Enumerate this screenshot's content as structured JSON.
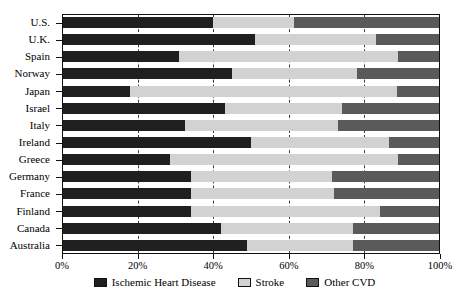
{
  "chart_data": {
    "type": "bar",
    "subtype": "stacked-horizontal-100",
    "title": "",
    "xlabel": "",
    "ylabel": "",
    "xlim": [
      0,
      100
    ],
    "xticks": [
      0,
      20,
      40,
      60,
      80,
      100
    ],
    "xtick_labels": [
      "0%",
      "20%",
      "40%",
      "60%",
      "80%",
      "100%"
    ],
    "grid": true,
    "grid_axis": "x",
    "grid_style": "dashed",
    "legend_position": "bottom-center",
    "categories": [
      "U.S.",
      "U.K.",
      "Spain",
      "Norway",
      "Japan",
      "Israel",
      "Italy",
      "Ireland",
      "Greece",
      "Germany",
      "France",
      "Finland",
      "Canada",
      "Australia"
    ],
    "series": [
      {
        "name": "Ischemic Heart Disease",
        "color": "#1f1f1f",
        "values": [
          40,
          51,
          31,
          45,
          18,
          43,
          32.5,
          50,
          28.5,
          34,
          34,
          34,
          42,
          49
        ]
      },
      {
        "name": "Stroke",
        "color": "#d2d2d2",
        "values": [
          21.5,
          32,
          58,
          33,
          70.5,
          31,
          40.5,
          36.5,
          60.5,
          37.5,
          38,
          50,
          35,
          28
        ]
      },
      {
        "name": "Other CVD",
        "color": "#5a5a5a",
        "values": [
          38.5,
          17,
          11,
          22,
          11.5,
          26,
          27,
          13.5,
          11,
          28.5,
          28,
          16,
          23,
          23
        ]
      }
    ]
  },
  "colors": {
    "ihd": "#1f1f1f",
    "stroke": "#d2d2d2",
    "other_cvd": "#5a5a5a",
    "axis": "#111111",
    "grid": "#3a3a3a",
    "background": "#ffffff"
  }
}
